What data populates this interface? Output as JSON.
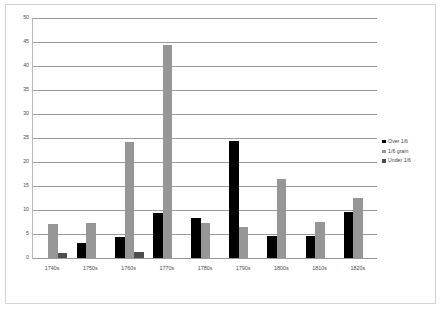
{
  "chart_data": {
    "type": "bar",
    "title": "",
    "subtitle": "",
    "xlabel": "",
    "ylabel": "",
    "ylim": [
      0,
      50
    ],
    "ytick_step": 5,
    "yticks": [
      0,
      5,
      10,
      15,
      20,
      25,
      30,
      35,
      40,
      45,
      50
    ],
    "grid": true,
    "legend_position": "right",
    "categories": [
      "1740s",
      "1750s",
      "1760s",
      "1770s",
      "1780s",
      "1790s",
      "1800s",
      "1810s",
      "1820s"
    ],
    "series": [
      {
        "name": "Over 1/6",
        "color": "#000000",
        "values": [
          0,
          3.1,
          4.3,
          9.3,
          8.3,
          24.4,
          4.5,
          4.6,
          9.6
        ]
      },
      {
        "name": "1/6 grain",
        "color": "#969696",
        "values": [
          7.0,
          7.2,
          24.2,
          44.3,
          7.3,
          6.5,
          16.4,
          7.6,
          12.6
        ]
      },
      {
        "name": "Under 1/6",
        "color": "#4d4d4d",
        "values": [
          1.1,
          0,
          1.2,
          0,
          0,
          0,
          0,
          0,
          0
        ]
      }
    ]
  },
  "legend": {
    "items": [
      {
        "label": "Over 1/6"
      },
      {
        "label": "1/6 grain"
      },
      {
        "label": "Under 1/6"
      }
    ]
  }
}
